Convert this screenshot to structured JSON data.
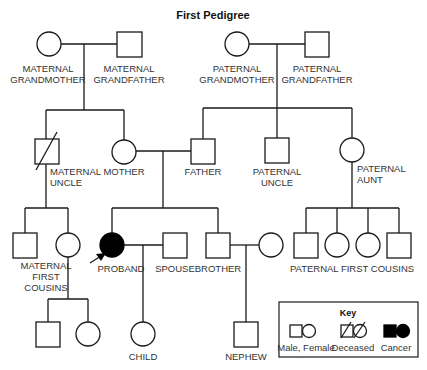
{
  "title": "First Pedigree",
  "people": {
    "maternal_grandmother": {
      "label1": "MATERNAL",
      "label2": "GRANDMOTHER",
      "sex": "female"
    },
    "maternal_grandfather": {
      "label1": "MATERNAL",
      "label2": "GRANDFATHER",
      "sex": "male"
    },
    "paternal_grandmother": {
      "label1": "PATERNAL",
      "label2": "GRANDMOTHER",
      "sex": "female"
    },
    "paternal_grandfather": {
      "label1": "PATERNAL",
      "label2": "GRANDFATHER",
      "sex": "male"
    },
    "maternal_uncle": {
      "label1": "MATERNAL",
      "label2": "UNCLE",
      "sex": "male",
      "status": "deceased"
    },
    "mother": {
      "label1": "MOTHER",
      "sex": "female"
    },
    "father": {
      "label1": "FATHER",
      "sex": "male"
    },
    "paternal_uncle": {
      "label1": "PATERNAL",
      "label2": "UNCLE",
      "sex": "male"
    },
    "paternal_aunt": {
      "label1": "PATERNAL",
      "label2": "AUNT",
      "sex": "female"
    },
    "maternal_first_cousins": {
      "label1": "MATERNAL",
      "label2": "FIRST",
      "label3": "COUSINS"
    },
    "proband": {
      "label1": "PROBAND",
      "sex": "female",
      "status": "cancer"
    },
    "spouse": {
      "label1": "SPOUSE",
      "sex": "male"
    },
    "brother": {
      "label1": "BROTHER",
      "sex": "male"
    },
    "paternal_first_cousins": {
      "label1": "PATERNAL FIRST COUSINS"
    },
    "child": {
      "label1": "CHILD",
      "sex": "female"
    },
    "nephew": {
      "label1": "NEPHEW",
      "sex": "male"
    }
  },
  "key": {
    "title": "Key",
    "items": [
      {
        "label": "Male, Female",
        "symbol": "square-circle-open"
      },
      {
        "label": "Deceased",
        "symbol": "square-circle-slashed"
      },
      {
        "label": "Cancer",
        "symbol": "square-circle-filled"
      }
    ]
  },
  "colors": {
    "line": "#1a1a1a",
    "affected": "#000000",
    "background": "#ffffff"
  }
}
